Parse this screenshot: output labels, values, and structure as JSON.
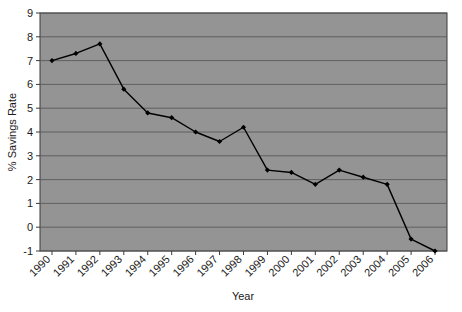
{
  "chart_data": {
    "type": "line",
    "title": "",
    "xlabel": "Year",
    "ylabel": "% Savings Rate",
    "categories": [
      "1990",
      "1991",
      "1992",
      "1993",
      "1994",
      "1995",
      "1996",
      "1997",
      "1998",
      "1999",
      "2000",
      "2001",
      "2002",
      "2003",
      "2004",
      "2005",
      "2006"
    ],
    "values": [
      7.0,
      7.3,
      7.7,
      5.8,
      4.8,
      4.6,
      4.0,
      3.6,
      4.2,
      2.4,
      2.3,
      1.8,
      2.4,
      2.1,
      1.8,
      -0.5,
      -1.0
    ],
    "series": [
      {
        "name": "% Savings Rate",
        "values": [
          7.0,
          7.3,
          7.7,
          5.8,
          4.8,
          4.6,
          4.0,
          3.6,
          4.2,
          2.4,
          2.3,
          1.8,
          2.4,
          2.1,
          1.8,
          -0.5,
          -1.0
        ]
      }
    ],
    "ylim": [
      -1,
      9
    ],
    "ytick_labels": [
      "9",
      "8",
      "7",
      "6",
      "5",
      "4",
      "3",
      "2",
      "1",
      "0",
      "-1"
    ],
    "ytick_values": [
      9,
      8,
      7,
      6,
      5,
      4,
      3,
      2,
      1,
      0,
      -1
    ],
    "ystep": 1,
    "grid": true,
    "grid_axis": "y",
    "legend": false,
    "legend_position": "none",
    "xtick_rotation": -45,
    "colors": {
      "plot_background": "#949494",
      "gridline": "#5a5a5a",
      "series_line": "#000000",
      "marker": "#000000",
      "axis": "#3a3a3a",
      "page_background": "#ffffff",
      "text": "#1a1a1a"
    }
  }
}
